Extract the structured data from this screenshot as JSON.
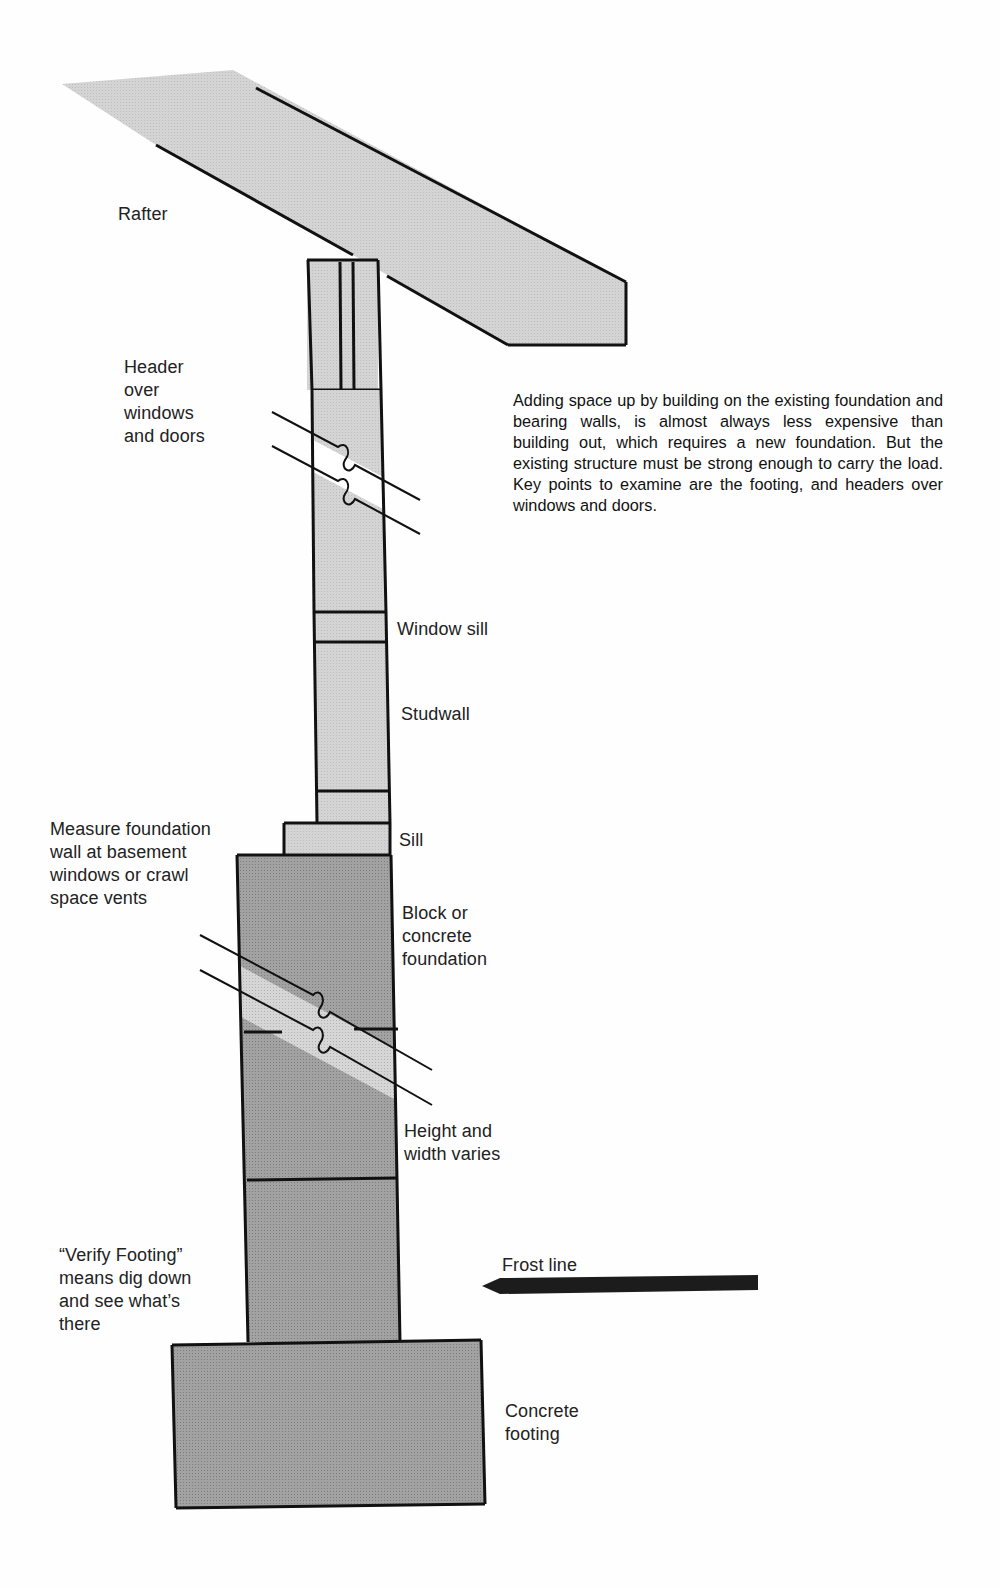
{
  "diagram": {
    "description": "Adding space up by building on the existing foundation and bearing walls, is almost always less expensive than building out, which requires a new foundation. But the existing structure must be strong enough to carry the load. Key points to examine are the footing, and headers over windows and doors.",
    "labels": {
      "rafter": "Rafter",
      "header": "Header\nover\nwindows\nand doors",
      "window_sill": "Window sill",
      "studwall": "Studwall",
      "sill": "Sill",
      "measure": "Measure foundation\nwall at basement\nwindows or crawl\nspace vents",
      "block": "Block or\nconcrete\nfoundation",
      "height": "Height and\nwidth varies",
      "verify": "“Verify Footing”\nmeans dig down\nand see what’s\nthere",
      "frost": "Frost line",
      "footing": "Concrete\nfooting"
    },
    "colors": {
      "light_fill": "#d2d2d2",
      "dark_fill": "#9c9c9c",
      "break_fill": "#cfcfcf",
      "stroke": "#111111",
      "frost_line": "#1c1c1c"
    },
    "components": [
      {
        "name": "Rafter",
        "type": "sloped member"
      },
      {
        "name": "Top plate / Header",
        "type": "framing"
      },
      {
        "name": "Window sill",
        "type": "framing"
      },
      {
        "name": "Studwall",
        "type": "framing"
      },
      {
        "name": "Sill",
        "type": "framing"
      },
      {
        "name": "Block or concrete foundation",
        "type": "masonry"
      },
      {
        "name": "Concrete footing",
        "type": "masonry"
      },
      {
        "name": "Frost line",
        "type": "reference line"
      }
    ]
  }
}
